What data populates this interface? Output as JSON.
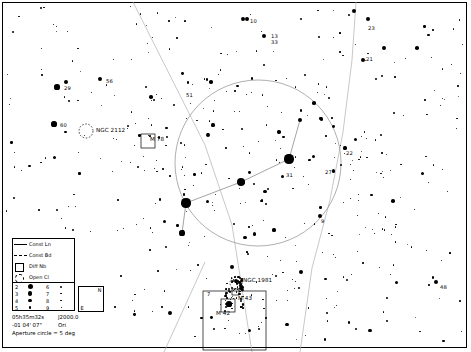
{
  "chart": {
    "background_color": "#ffffff",
    "ink_color": "#000000"
  },
  "legend": {
    "items": [
      {
        "symbol": "const-line",
        "label": "Const Ln"
      },
      {
        "symbol": "const-boundary",
        "label": "Const Bd"
      },
      {
        "symbol": "diffuse-nebula",
        "label": "Diff Nb"
      },
      {
        "symbol": "open-cluster",
        "label": "Open Cl"
      }
    ]
  },
  "magnitude_scale": {
    "left": [
      {
        "mag": "2",
        "size": 5.0
      },
      {
        "mag": "3",
        "size": 4.2
      },
      {
        "mag": "4",
        "size": 3.4
      },
      {
        "mag": "5",
        "size": 2.6
      }
    ],
    "right": [
      {
        "mag": "6",
        "size": 2.0
      },
      {
        "mag": "7",
        "size": 1.6
      },
      {
        "mag": "8",
        "size": 1.3
      },
      {
        "mag": "9",
        "size": 1.0
      }
    ]
  },
  "compass": {
    "north": "N",
    "east": "E"
  },
  "coordinates": {
    "ra": "05h35m32s",
    "dec": "-01 04' 07\"",
    "epoch": "J2000.0",
    "constellation": "Ori",
    "aperture_note": "Aperture circle = 5 deg"
  },
  "deep_sky_objects": [
    {
      "name": "NGC 2112",
      "type": "open-cluster",
      "x": 96,
      "y": 128,
      "marker_x": 86,
      "marker_y": 131,
      "marker_r": 7
    },
    {
      "name": "M 78",
      "type": "diffuse-nebula",
      "x": 150,
      "y": 137,
      "marker_x": 148,
      "marker_y": 141,
      "marker_w": 14,
      "marker_h": 14
    },
    {
      "name": "NGC 1981",
      "type": "open-cluster",
      "x": 243,
      "y": 278,
      "marker_x": 236,
      "marker_y": 283,
      "marker_r": 6
    },
    {
      "name": "M 42",
      "type": "diffuse-nebula",
      "x": 216,
      "y": 311,
      "marker_x": 228,
      "marker_y": 305,
      "marker_w": 14,
      "marker_h": 13
    },
    {
      "name": "M 43",
      "type": "diffuse-nebula",
      "x": 238,
      "y": 296,
      "marker_x": 235,
      "marker_y": 292,
      "marker_w": 7,
      "marker_h": 6
    }
  ],
  "star_labels": [
    {
      "text": "10",
      "x": 250,
      "y": 19
    },
    {
      "text": "23",
      "x": 368,
      "y": 26
    },
    {
      "text": "13",
      "x": 271,
      "y": 34
    },
    {
      "text": "33",
      "x": 271,
      "y": 40
    },
    {
      "text": "21",
      "x": 366,
      "y": 57
    },
    {
      "text": "29",
      "x": 64,
      "y": 86
    },
    {
      "text": "56",
      "x": 106,
      "y": 79
    },
    {
      "text": "51",
      "x": 186,
      "y": 93
    },
    {
      "text": "60",
      "x": 60,
      "y": 123
    },
    {
      "text": "22",
      "x": 346,
      "y": 151
    },
    {
      "text": "27",
      "x": 325,
      "y": 170
    },
    {
      "text": "31",
      "x": 286,
      "y": 173
    },
    {
      "text": "9",
      "x": 321,
      "y": 219
    },
    {
      "text": "7",
      "x": 207,
      "y": 292
    },
    {
      "text": "48",
      "x": 440,
      "y": 285
    }
  ],
  "aperture_circle": {
    "cx": 258,
    "cy": 163,
    "r": 83
  }
}
